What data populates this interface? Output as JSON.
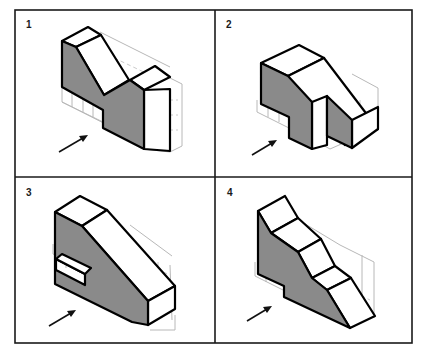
{
  "figure": {
    "panels": [
      {
        "number": "1",
        "shape": "V-notch block with tall right post",
        "arrow": "viewing-direction"
      },
      {
        "number": "2",
        "shape": "Stepped block with slot and sloped top",
        "arrow": "viewing-direction"
      },
      {
        "number": "3",
        "shape": "Sloped wedge block with rectangular slot",
        "arrow": "viewing-direction"
      },
      {
        "number": "4",
        "shape": "Stepped staircase slope block",
        "arrow": "viewing-direction"
      }
    ],
    "colors": {
      "shaded_face": "#8a8a8a",
      "outline": "#000000",
      "ghost_grid": "#b8b8b8",
      "frame": "#1a1a1a"
    }
  }
}
